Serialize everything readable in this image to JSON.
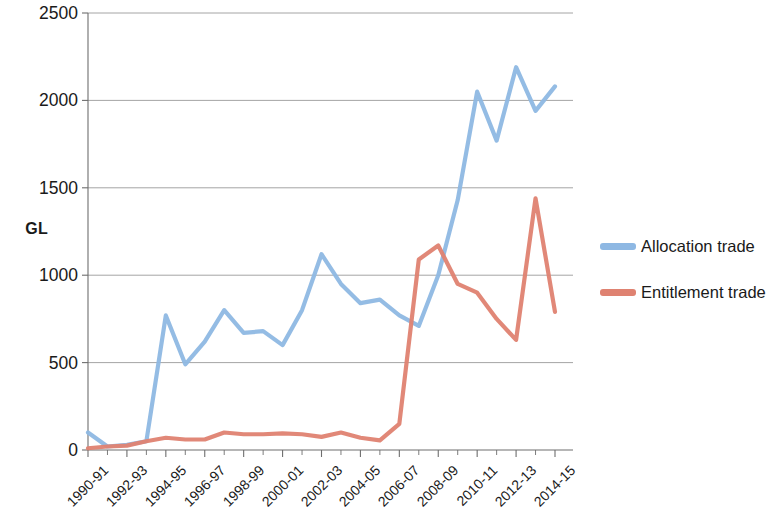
{
  "chart_data": {
    "type": "line",
    "title": "",
    "xlabel": "",
    "ylabel": "GL",
    "ylim": [
      0,
      2500
    ],
    "yticks": [
      0,
      500,
      1000,
      1500,
      2000,
      2500
    ],
    "ytick_labels": [
      "0",
      "500",
      "1000",
      "1500",
      "2000",
      "2500"
    ],
    "grid": true,
    "grid_axis": "y",
    "legend_position": "right",
    "x": [
      "1990-91",
      "1991-92",
      "1992-93",
      "1993-94",
      "1994-95",
      "1995-96",
      "1996-97",
      "1997-98",
      "1998-99",
      "1999-2000",
      "2000-01",
      "2001-02",
      "2002-03",
      "2003-04",
      "2004-05",
      "2005-06",
      "2006-07",
      "2007-08",
      "2008-09",
      "2009-10",
      "2010-11",
      "2011-12",
      "2012-13",
      "2013-14",
      "2014-15"
    ],
    "xtick_labels_shown": [
      "1990-91",
      "1992-93",
      "1994-95",
      "1996-97",
      "1998-99",
      "2000-01",
      "2002-03",
      "2004-05",
      "2006-07",
      "2008-09",
      "2010-11",
      "2012-13",
      "2014-15"
    ],
    "series": [
      {
        "name": "Allocation trade",
        "color": "#8EB8E3",
        "values": [
          100,
          20,
          30,
          50,
          770,
          490,
          620,
          800,
          670,
          680,
          600,
          800,
          1120,
          950,
          840,
          860,
          770,
          710,
          1000,
          1430,
          2050,
          1770,
          2190,
          1940,
          2080
        ]
      },
      {
        "name": "Entitlement trade",
        "color": "#DF8271",
        "values": [
          10,
          20,
          25,
          50,
          70,
          60,
          60,
          100,
          90,
          90,
          95,
          90,
          75,
          100,
          70,
          55,
          150,
          1090,
          1170,
          950,
          900,
          750,
          630,
          1440,
          790
        ]
      }
    ]
  },
  "legend": {
    "items": [
      {
        "label": "Allocation trade",
        "color": "#8EB8E3"
      },
      {
        "label": "Entitlement trade",
        "color": "#DF8271"
      }
    ]
  }
}
